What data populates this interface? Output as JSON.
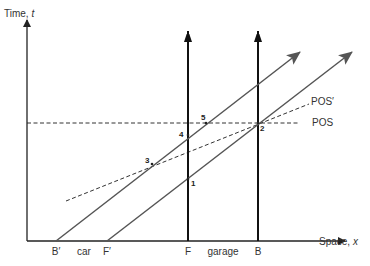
{
  "figure": {
    "type": "spacetime-diagram",
    "width": 370,
    "height": 266
  },
  "colors": {
    "axis": "#222222",
    "worldline": "#555555",
    "dashed": "#333333",
    "text": "#333333",
    "background": "#ffffff"
  },
  "axes": {
    "time": {
      "label": "Time, ",
      "var": "t",
      "x": 27,
      "y_bottom": 241,
      "y_top": 20,
      "label_x": 4,
      "label_y": 17
    },
    "space": {
      "label": "Space, ",
      "var": "x",
      "y": 241,
      "x_left": 27,
      "x_right": 345,
      "label_x": 319,
      "label_y": 245
    }
  },
  "tick_labels": [
    {
      "text": "B′",
      "x": 56,
      "y": 255
    },
    {
      "text": "car",
      "x": 84,
      "y": 255
    },
    {
      "text": "F′",
      "x": 107,
      "y": 255
    },
    {
      "text": "F",
      "x": 188,
      "y": 255
    },
    {
      "text": "garage",
      "x": 223,
      "y": 255
    },
    {
      "text": "B",
      "x": 258,
      "y": 255
    }
  ],
  "garage_walls": [
    {
      "name": "F",
      "x": 188,
      "y_bottom": 241,
      "y_top": 31
    },
    {
      "name": "B",
      "x": 258,
      "y_bottom": 241,
      "y_top": 31
    }
  ],
  "car_worldlines": [
    {
      "name": "B′",
      "x1": 56,
      "y1": 241,
      "x2": 300,
      "y2": 52
    },
    {
      "name": "F′",
      "x1": 107,
      "y1": 241,
      "x2": 352,
      "y2": 52
    }
  ],
  "simultaneity_lines": [
    {
      "label": "POS",
      "x1": 27,
      "y1": 123,
      "x2": 300,
      "y2": 123,
      "label_x": 312,
      "label_y": 126
    },
    {
      "label": "POS′",
      "x1": 66,
      "y1": 201,
      "x2": 309,
      "y2": 104,
      "label_x": 311,
      "label_y": 105
    }
  ],
  "events": [
    {
      "label": "1",
      "x": 188,
      "y": 179,
      "lx": 191,
      "ly": 186
    },
    {
      "label": "2",
      "x": 258,
      "y": 123,
      "lx": 260,
      "ly": 131
    },
    {
      "label": "3",
      "x": 152,
      "y": 164,
      "lx": 145,
      "ly": 163
    },
    {
      "label": "4",
      "x": 188,
      "y": 135,
      "lx": 179,
      "ly": 137
    },
    {
      "label": "5",
      "x": 206,
      "y": 123,
      "lx": 201,
      "ly": 120
    }
  ]
}
